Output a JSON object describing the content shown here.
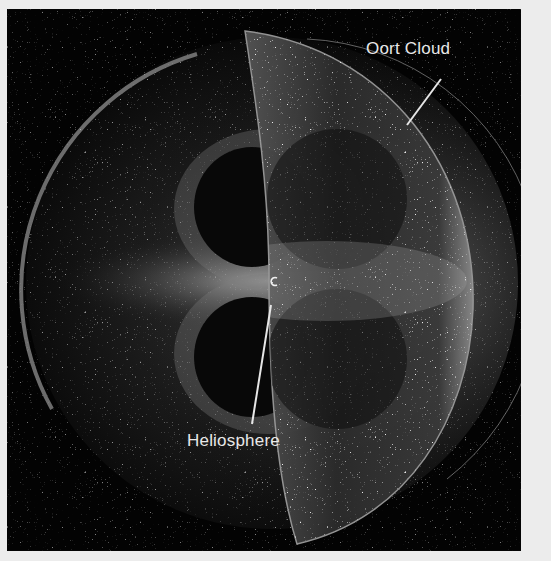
{
  "figure": {
    "background_color": "#030303",
    "border_color": "#ececec",
    "labels": {
      "outer": "Oort Cloud",
      "inner": "Heliosphere"
    }
  }
}
